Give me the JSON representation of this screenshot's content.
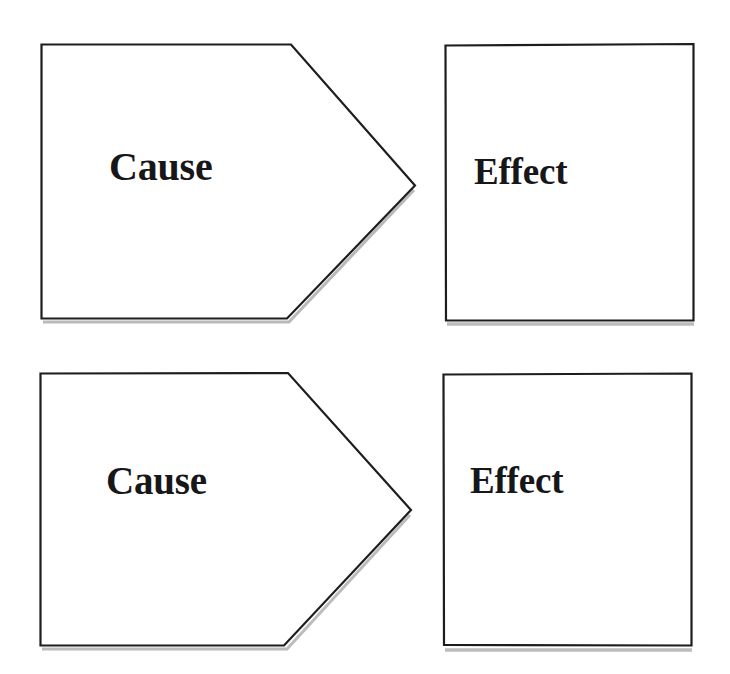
{
  "document": {
    "title": "Cause and Effect Diagram",
    "background_color": "#ffffff",
    "stroke_color": "#1a1a1a",
    "text_color": "#17171a"
  },
  "diagram": {
    "type": "cause-effect",
    "pairs": [
      {
        "id": "pair-1",
        "cause": {
          "label": "Cause",
          "shape": "pentagon-arrow-right"
        },
        "effect": {
          "label": "Effect",
          "shape": "rectangle"
        }
      },
      {
        "id": "pair-2",
        "cause": {
          "label": "Cause",
          "shape": "pentagon-arrow-right"
        },
        "effect": {
          "label": "Effect",
          "shape": "rectangle"
        }
      }
    ]
  }
}
